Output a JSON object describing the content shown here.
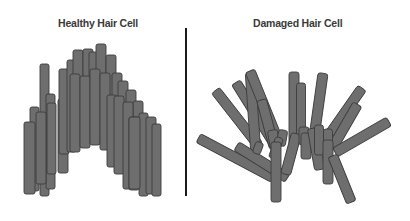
{
  "panels": {
    "left": {
      "title": "Healthy Hair Cell"
    },
    "right": {
      "title": "Damaged Hair Cell"
    }
  },
  "colors": {
    "bar_fill": "#6e6e6e",
    "bar_stroke": "#3c3c3c",
    "divider": "#1a1a1a",
    "title_text": "#3a3a3a"
  },
  "healthy_bars": [
    {
      "x": 40,
      "y": 64,
      "w": 9,
      "h": 132
    },
    {
      "x": 30,
      "y": 107,
      "w": 9,
      "h": 84
    },
    {
      "x": 46,
      "y": 94,
      "w": 9,
      "h": 95
    },
    {
      "x": 24,
      "y": 122,
      "w": 11,
      "h": 72
    },
    {
      "x": 36,
      "y": 112,
      "w": 10,
      "h": 72
    },
    {
      "x": 47,
      "y": 103,
      "w": 9,
      "h": 71
    },
    {
      "x": 58,
      "y": 99,
      "w": 10,
      "h": 74
    },
    {
      "x": 59,
      "y": 69,
      "w": 10,
      "h": 85
    },
    {
      "x": 67,
      "y": 60,
      "w": 9,
      "h": 92
    },
    {
      "x": 73,
      "y": 50,
      "w": 10,
      "h": 97
    },
    {
      "x": 83,
      "y": 49,
      "w": 10,
      "h": 90
    },
    {
      "x": 89,
      "y": 52,
      "w": 10,
      "h": 85
    },
    {
      "x": 96,
      "y": 44,
      "w": 10,
      "h": 100
    },
    {
      "x": 106,
      "y": 55,
      "w": 10,
      "h": 95
    },
    {
      "x": 70,
      "y": 74,
      "w": 10,
      "h": 78
    },
    {
      "x": 80,
      "y": 76,
      "w": 10,
      "h": 72
    },
    {
      "x": 90,
      "y": 69,
      "w": 10,
      "h": 76
    },
    {
      "x": 100,
      "y": 73,
      "w": 10,
      "h": 77
    },
    {
      "x": 112,
      "y": 73,
      "w": 10,
      "h": 90
    },
    {
      "x": 118,
      "y": 81,
      "w": 10,
      "h": 85
    },
    {
      "x": 126,
      "y": 90,
      "w": 10,
      "h": 80
    },
    {
      "x": 133,
      "y": 101,
      "w": 10,
      "h": 86
    },
    {
      "x": 139,
      "y": 113,
      "w": 9,
      "h": 83
    },
    {
      "x": 146,
      "y": 117,
      "w": 10,
      "h": 77
    },
    {
      "x": 152,
      "y": 124,
      "w": 9,
      "h": 72
    },
    {
      "x": 107,
      "y": 95,
      "w": 10,
      "h": 72
    },
    {
      "x": 114,
      "y": 96,
      "w": 10,
      "h": 78
    },
    {
      "x": 123,
      "y": 102,
      "w": 10,
      "h": 87
    },
    {
      "x": 129,
      "y": 117,
      "w": 10,
      "h": 73
    },
    {
      "x": 129,
      "y": 117,
      "w": 11,
      "h": 72
    }
  ],
  "damaged_bars": [
    {
      "cx": 237,
      "cy": 118,
      "len": 70,
      "w": 10,
      "angle": -38
    },
    {
      "cx": 255,
      "cy": 113,
      "len": 72,
      "w": 10,
      "angle": -32
    },
    {
      "cx": 253,
      "cy": 112,
      "len": 78,
      "w": 10,
      "angle": -4
    },
    {
      "cx": 265,
      "cy": 108,
      "len": 80,
      "w": 10,
      "angle": -22
    },
    {
      "cx": 268,
      "cy": 124,
      "len": 50,
      "w": 10,
      "angle": -15
    },
    {
      "cx": 294,
      "cy": 108,
      "len": 72,
      "w": 10,
      "angle": 0
    },
    {
      "cx": 301,
      "cy": 113,
      "len": 60,
      "w": 9,
      "angle": 0
    },
    {
      "cx": 319,
      "cy": 102,
      "len": 58,
      "w": 10,
      "angle": 8
    },
    {
      "cx": 346,
      "cy": 111,
      "len": 56,
      "w": 10,
      "angle": 35
    },
    {
      "cx": 345,
      "cy": 126,
      "len": 50,
      "w": 10,
      "angle": 30
    },
    {
      "cx": 362,
      "cy": 137,
      "len": 62,
      "w": 10,
      "angle": 60
    },
    {
      "cx": 236,
      "cy": 158,
      "len": 85,
      "w": 10,
      "angle": -62
    },
    {
      "cx": 262,
      "cy": 162,
      "len": 60,
      "w": 10,
      "angle": -58
    },
    {
      "cx": 274,
      "cy": 140,
      "len": 20,
      "w": 10,
      "angle": -10
    },
    {
      "cx": 282,
      "cy": 138,
      "len": 16,
      "w": 9,
      "angle": 10
    },
    {
      "cx": 291,
      "cy": 154,
      "len": 42,
      "w": 10,
      "angle": 15
    },
    {
      "cx": 304,
      "cy": 136,
      "len": 18,
      "w": 10,
      "angle": 0
    },
    {
      "cx": 306,
      "cy": 146,
      "len": 26,
      "w": 10,
      "angle": 0
    },
    {
      "cx": 316,
      "cy": 149,
      "len": 42,
      "w": 10,
      "angle": -10
    },
    {
      "cx": 319,
      "cy": 140,
      "len": 30,
      "w": 9,
      "angle": 0
    },
    {
      "cx": 328,
      "cy": 138,
      "len": 18,
      "w": 9,
      "angle": 0
    },
    {
      "cx": 328,
      "cy": 162,
      "len": 44,
      "w": 10,
      "angle": 0
    },
    {
      "cx": 342,
      "cy": 179,
      "len": 50,
      "w": 10,
      "angle": -22
    },
    {
      "cx": 276,
      "cy": 148,
      "len": 22,
      "w": 8,
      "angle": 20
    },
    {
      "cx": 258,
      "cy": 148,
      "len": 12,
      "w": 8,
      "angle": 20
    },
    {
      "cx": 276,
      "cy": 172,
      "len": 60,
      "w": 10,
      "angle": 0
    }
  ]
}
